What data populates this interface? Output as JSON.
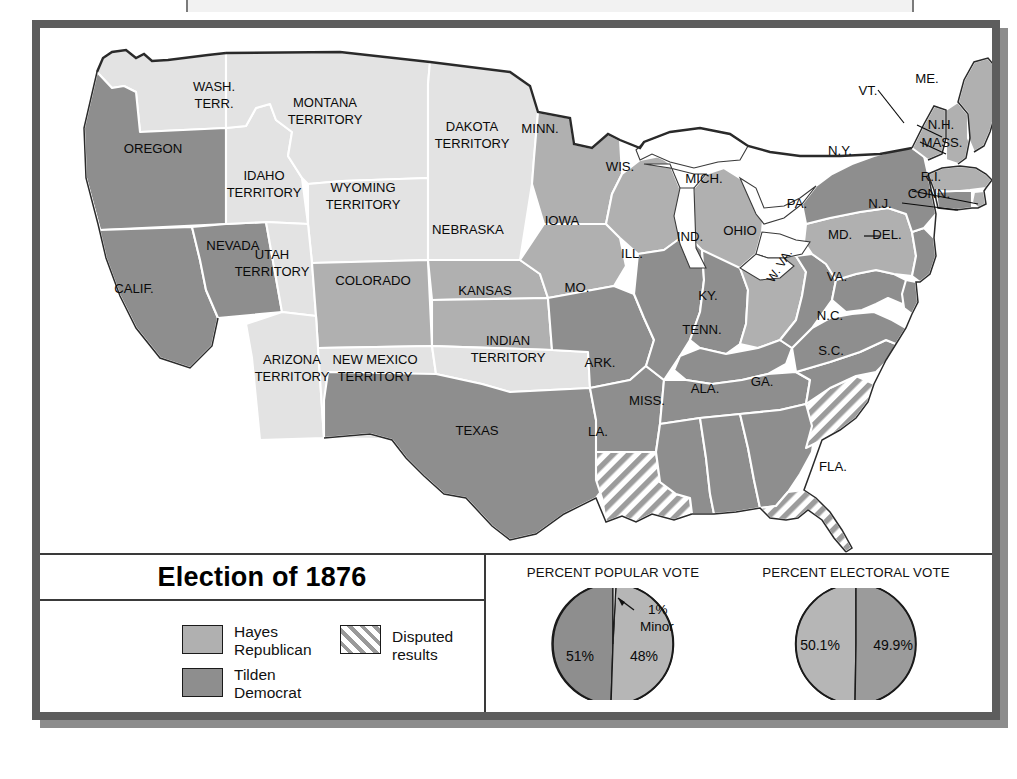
{
  "title_bar": {
    "title": "Election of 1876"
  },
  "legend": {
    "title": "Election of 1876",
    "items": [
      {
        "key": "hayes",
        "label_line1": "Hayes",
        "label_line2": "Republican",
        "color": "#b0b0b0"
      },
      {
        "key": "tilden",
        "label_line1": "Tilden",
        "label_line2": "Democrat",
        "color": "#8e8e8e"
      }
    ],
    "disputed": {
      "label": "Disputed results",
      "pattern": "diagonal-hatch"
    }
  },
  "charts": {
    "popular": {
      "caption": "PERCENT POPULAR VOTE",
      "slices": [
        {
          "label": "51%",
          "value": 51,
          "party": "tilden",
          "color": "#8e8e8e"
        },
        {
          "label": "48%",
          "value": 48,
          "party": "hayes",
          "color": "#b6b6b6"
        },
        {
          "label": "1%",
          "value": 1,
          "party": "minor",
          "color": "#d8d8d8"
        }
      ],
      "minor_label_line1": "1%",
      "minor_label_line2": "Minor"
    },
    "electoral": {
      "caption": "PERCENT ELECTORAL VOTE",
      "slices": [
        {
          "label": "50.1%",
          "value": 50.1,
          "party": "hayes",
          "color": "#b6b6b6"
        },
        {
          "label": "49.9%",
          "value": 49.9,
          "party": "tilden",
          "color": "#9b9b9b"
        }
      ]
    }
  },
  "map": {
    "states": [
      {
        "id": "wash-terr",
        "label": "WASH.\nTERR.",
        "fill": "territory"
      },
      {
        "id": "oregon",
        "label": "OREGON",
        "fill": "tilden"
      },
      {
        "id": "calif",
        "label": "CALIF.",
        "fill": "tilden"
      },
      {
        "id": "nevada",
        "label": "NEVADA",
        "fill": "tilden"
      },
      {
        "id": "idaho-terr",
        "label": "IDAHO\nTERRITORY",
        "fill": "territory"
      },
      {
        "id": "montana-terr",
        "label": "MONTANA\nTERRITORY",
        "fill": "territory"
      },
      {
        "id": "wyoming-terr",
        "label": "WYOMING\nTERRITORY",
        "fill": "territory"
      },
      {
        "id": "utah-terr",
        "label": "UTAH\nTERRITORY",
        "fill": "territory"
      },
      {
        "id": "arizona-terr",
        "label": "ARIZONA\nTERRITORY",
        "fill": "territory"
      },
      {
        "id": "new-mexico-terr",
        "label": "NEW MEXICO\nTERRITORY",
        "fill": "territory"
      },
      {
        "id": "colorado",
        "label": "COLORADO",
        "fill": "hayes"
      },
      {
        "id": "dakota-terr",
        "label": "DAKOTA\nTERRITORY",
        "fill": "territory"
      },
      {
        "id": "nebraska",
        "label": "NEBRASKA",
        "fill": "hayes"
      },
      {
        "id": "kansas",
        "label": "KANSAS",
        "fill": "hayes"
      },
      {
        "id": "indian-terr",
        "label": "INDIAN\nTERRITORY",
        "fill": "territory"
      },
      {
        "id": "texas",
        "label": "TEXAS",
        "fill": "tilden"
      },
      {
        "id": "minn",
        "label": "MINN.",
        "fill": "hayes"
      },
      {
        "id": "iowa",
        "label": "IOWA",
        "fill": "hayes"
      },
      {
        "id": "missouri",
        "label": "MO.",
        "fill": "tilden"
      },
      {
        "id": "arkansas",
        "label": "ARK.",
        "fill": "tilden"
      },
      {
        "id": "louisiana",
        "label": "LA.",
        "fill": "disputed"
      },
      {
        "id": "wisconsin",
        "label": "WIS.",
        "fill": "hayes"
      },
      {
        "id": "illinois",
        "label": "ILL.",
        "fill": "tilden"
      },
      {
        "id": "michigan",
        "label": "MICH.",
        "fill": "hayes"
      },
      {
        "id": "indiana",
        "label": "IND.",
        "fill": "tilden"
      },
      {
        "id": "ohio",
        "label": "OHIO",
        "fill": "hayes"
      },
      {
        "id": "kentucky",
        "label": "KY.",
        "fill": "tilden"
      },
      {
        "id": "tennessee",
        "label": "TENN.",
        "fill": "tilden"
      },
      {
        "id": "mississippi",
        "label": "MISS.",
        "fill": "tilden"
      },
      {
        "id": "alabama",
        "label": "ALA.",
        "fill": "tilden"
      },
      {
        "id": "georgia",
        "label": "GA.",
        "fill": "tilden"
      },
      {
        "id": "florida",
        "label": "FLA.",
        "fill": "disputed"
      },
      {
        "id": "south-carolina",
        "label": "S.C.",
        "fill": "disputed"
      },
      {
        "id": "north-carolina",
        "label": "N.C.",
        "fill": "tilden"
      },
      {
        "id": "virginia",
        "label": "VA.",
        "fill": "tilden"
      },
      {
        "id": "west-virginia",
        "label": "W. VA.",
        "fill": "tilden"
      },
      {
        "id": "maryland",
        "label": "MD.",
        "fill": "tilden"
      },
      {
        "id": "delaware",
        "label": "DEL.",
        "fill": "tilden"
      },
      {
        "id": "pennsylvania",
        "label": "PA.",
        "fill": "hayes"
      },
      {
        "id": "new-jersey",
        "label": "N.J.",
        "fill": "tilden"
      },
      {
        "id": "new-york",
        "label": "N.Y.",
        "fill": "tilden"
      },
      {
        "id": "connecticut",
        "label": "CONN.",
        "fill": "tilden"
      },
      {
        "id": "rhode-island",
        "label": "R.I.",
        "fill": "hayes"
      },
      {
        "id": "massachusetts",
        "label": "MASS.",
        "fill": "hayes"
      },
      {
        "id": "vermont",
        "label": "VT.",
        "fill": "hayes"
      },
      {
        "id": "new-hampshire",
        "label": "N.H.",
        "fill": "hayes"
      },
      {
        "id": "maine",
        "label": "ME.",
        "fill": "hayes"
      }
    ],
    "labels": {
      "wash_terr_1": "WASH.",
      "wash_terr_2": "TERR.",
      "oregon": "OREGON",
      "calif": "CALIF.",
      "nevada": "NEVADA",
      "idaho_1": "IDAHO",
      "idaho_2": "TERRITORY",
      "montana_1": "MONTANA",
      "montana_2": "TERRITORY",
      "wyoming_1": "WYOMING",
      "wyoming_2": "TERRITORY",
      "utah_1": "UTAH",
      "utah_2": "TERRITORY",
      "arizona_1": "ARIZONA",
      "arizona_2": "TERRITORY",
      "newmexico_1": "NEW MEXICO",
      "newmexico_2": "TERRITORY",
      "colorado": "COLORADO",
      "dakota_1": "DAKOTA",
      "dakota_2": "TERRITORY",
      "nebraska": "NEBRASKA",
      "kansas": "KANSAS",
      "indian_1": "INDIAN",
      "indian_2": "TERRITORY",
      "texas": "TEXAS",
      "minn": "MINN.",
      "iowa": "IOWA",
      "missouri": "MO.",
      "arkansas": "ARK.",
      "louisiana": "LA.",
      "wisconsin": "WIS.",
      "illinois": "ILL.",
      "michigan": "MICH.",
      "indiana": "IND.",
      "ohio": "OHIO",
      "kentucky": "KY.",
      "tennessee": "TENN.",
      "mississippi": "MISS.",
      "alabama": "ALA.",
      "georgia": "GA.",
      "florida": "FLA.",
      "southcarolina": "S.C.",
      "northcarolina": "N.C.",
      "virginia": "VA.",
      "westvirginia": "W. VA.",
      "maryland": "MD.",
      "delaware": "DEL.",
      "pennsylvania": "PA.",
      "newjersey": "N.J.",
      "newyork": "N.Y.",
      "connecticut": "CONN.",
      "rhodeisland": "R.I.",
      "massachusetts": "MASS.",
      "vermont": "VT.",
      "newhampshire": "N.H.",
      "maine": "ME."
    }
  },
  "colors": {
    "hayes": "#b0b0b0",
    "tilden": "#8e8e8e",
    "territory": "#e3e3e3",
    "frame": "#5d5d5d",
    "shadow": "#8c8c8c",
    "outline": "#ffffff",
    "coast": "#2a2a2a"
  }
}
